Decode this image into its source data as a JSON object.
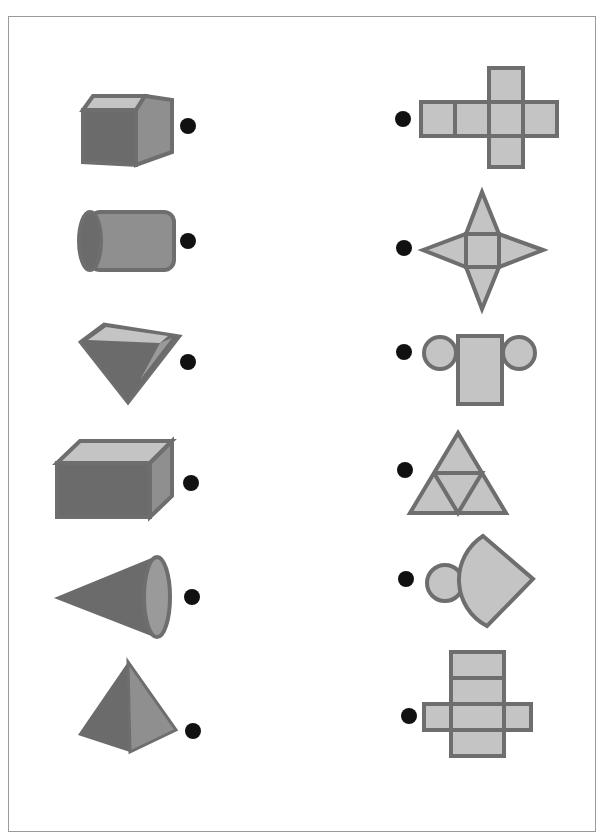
{
  "worksheet": {
    "title_fragment": "",
    "instruction": "Match each solid to its net",
    "colors": {
      "dark_face": "#6b6b6b",
      "mid_face": "#8f8f8f",
      "light_face": "#c4c4c4",
      "outline": "#6e6e6e",
      "dot": "#111111",
      "frame": "#9a9a9a"
    },
    "solids": [
      {
        "id": "cube",
        "label": "cube"
      },
      {
        "id": "cylinder",
        "label": "cylinder"
      },
      {
        "id": "triangular-pyramid-inverted",
        "label": "inverted pyramid"
      },
      {
        "id": "rectangular-prism",
        "label": "rectangular prism"
      },
      {
        "id": "cone",
        "label": "cone"
      },
      {
        "id": "tetrahedron",
        "label": "triangular pyramid"
      }
    ],
    "nets": [
      {
        "id": "cube-net",
        "label": "cross net of six squares"
      },
      {
        "id": "square-pyramid-net",
        "label": "square with four triangles"
      },
      {
        "id": "cylinder-net",
        "label": "rectangle with two circles"
      },
      {
        "id": "tetrahedron-net",
        "label": "triangle of four triangles"
      },
      {
        "id": "cone-net",
        "label": "circle with sector"
      },
      {
        "id": "rect-prism-net",
        "label": "rectangular prism net"
      }
    ]
  }
}
